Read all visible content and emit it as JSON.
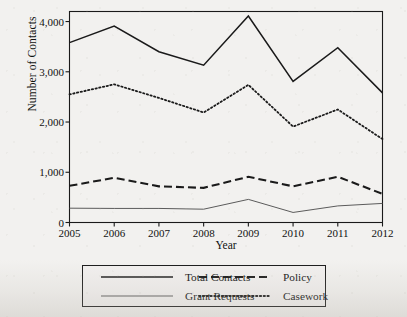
{
  "chart_data": {
    "type": "line",
    "title": "",
    "xlabel": "Year",
    "ylabel": "Number of Contacts",
    "categories": [
      "2005",
      "2006",
      "2007",
      "2008",
      "2009",
      "2010",
      "2011",
      "2012"
    ],
    "x": [
      2005,
      2006,
      2007,
      2008,
      2009,
      2010,
      2011,
      2012
    ],
    "xlim": [
      2005,
      2012
    ],
    "ylim": [
      0,
      4200
    ],
    "yticks": [
      0,
      1000,
      2000,
      3000,
      4000
    ],
    "ytick_labels": [
      "0",
      "1,000",
      "2,000",
      "3,000",
      "4,000"
    ],
    "grid": false,
    "legend_position": "below-axes",
    "series": [
      {
        "name": "Total Contacts",
        "style": "solid",
        "color": "#1a1a1a",
        "values": [
          3580,
          3910,
          3400,
          3130,
          4110,
          2810,
          3480,
          2580
        ]
      },
      {
        "name": "Policy",
        "style": "dashed",
        "color": "#1a1a1a",
        "values": [
          730,
          890,
          720,
          690,
          910,
          720,
          910,
          570
        ]
      },
      {
        "name": "Grant Requests",
        "style": "thin-solid",
        "color": "#5b5b5b",
        "values": [
          285,
          280,
          280,
          265,
          460,
          200,
          330,
          380
        ]
      },
      {
        "name": "Casework",
        "style": "dotted",
        "color": "#1a1a1a",
        "values": [
          2550,
          2750,
          2480,
          2190,
          2740,
          1910,
          2250,
          1660
        ]
      }
    ]
  },
  "axes": {
    "ylabel": "Number of Contacts",
    "xlabel": "Year"
  },
  "legend": {
    "items": [
      {
        "label": "Total Contacts",
        "style": "solid"
      },
      {
        "label": "Policy",
        "style": "dashed"
      },
      {
        "label": "Grant Requests",
        "style": "thin-solid"
      },
      {
        "label": "Casework",
        "style": "dotted"
      }
    ]
  }
}
